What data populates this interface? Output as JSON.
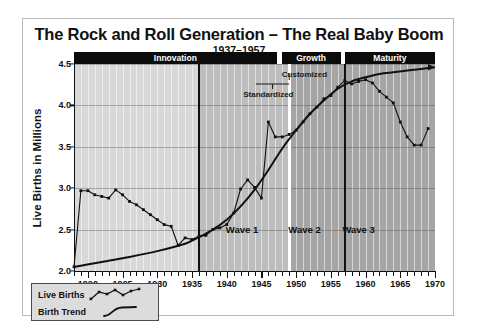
{
  "title": "The Rock and Roll Generation – The Real Baby Boom",
  "subtitle": "1937–1957",
  "legend": {
    "series1_label": "Live Births",
    "series2_label": "Birth Trend"
  },
  "annotations": {
    "standardized": "Standardized",
    "customized": "Customized",
    "wave1": "Wave 1",
    "wave2": "Wave 2",
    "wave3": "Wave 3"
  },
  "phases": [
    {
      "label": "Innovation",
      "start": 1918,
      "end": 1947.2
    },
    {
      "label": "Growth",
      "start": 1947.9,
      "end": 1956.4
    },
    {
      "label": "Maturity",
      "start": 1957.0,
      "end": 1970
    }
  ],
  "colors": {
    "band_light": "#d8d8d8",
    "band_mid": "#bdbdbd",
    "band_dark": "#a5a5a5",
    "phase_bar": "#0b0b0b",
    "line": "#111111",
    "frame": "#b9b9bd",
    "legend_bg": "#dcdcdc"
  },
  "chart_data": {
    "type": "line",
    "title": "The Rock and Roll Generation – The Real Baby Boom",
    "subtitle": "1937–1957",
    "xlabel": "",
    "ylabel": "Live Births in Millions",
    "xlim": [
      1918,
      1970
    ],
    "ylim": [
      2.0,
      4.5
    ],
    "yticks": [
      2.0,
      2.5,
      3.0,
      3.5,
      4.0,
      4.5
    ],
    "xticks": [
      1920,
      1925,
      1930,
      1935,
      1940,
      1945,
      1950,
      1955,
      1960,
      1965,
      1970
    ],
    "xtick_minor_step": 1,
    "grid": true,
    "legend_position": "below-left",
    "series": [
      {
        "name": "Live Births",
        "marker": "square",
        "x": [
          1918,
          1919,
          1920,
          1921,
          1922,
          1923,
          1924,
          1925,
          1926,
          1927,
          1928,
          1929,
          1930,
          1931,
          1932,
          1933,
          1934,
          1935,
          1936,
          1937,
          1938,
          1939,
          1940,
          1941,
          1942,
          1943,
          1944,
          1945,
          1946,
          1947,
          1948,
          1949,
          1950,
          1951,
          1952,
          1953,
          1954,
          1955,
          1956,
          1957,
          1958,
          1959,
          1960,
          1961,
          1962,
          1963,
          1964,
          1965,
          1966,
          1967,
          1968,
          1969
        ],
        "y": [
          2.05,
          2.97,
          2.97,
          2.92,
          2.9,
          2.88,
          2.98,
          2.92,
          2.84,
          2.8,
          2.74,
          2.68,
          2.62,
          2.56,
          2.54,
          2.31,
          2.4,
          2.38,
          2.42,
          2.43,
          2.5,
          2.52,
          2.56,
          2.7,
          2.99,
          3.1,
          3.01,
          2.88,
          3.8,
          3.62,
          3.62,
          3.65,
          3.7,
          3.8,
          3.9,
          3.98,
          4.08,
          4.12,
          4.22,
          4.3,
          4.26,
          4.29,
          4.31,
          4.27,
          4.17,
          4.1,
          4.03,
          3.8,
          3.62,
          3.52,
          3.52,
          3.72
        ]
      },
      {
        "name": "Birth Trend",
        "marker": "none",
        "arrow_end": true,
        "x": [
          1918,
          1922,
          1926,
          1930,
          1934,
          1936,
          1938,
          1940,
          1942,
          1944,
          1946,
          1948,
          1950,
          1952,
          1954,
          1956,
          1958,
          1960,
          1962,
          1964,
          1966,
          1968,
          1970
        ],
        "y": [
          2.05,
          2.11,
          2.17,
          2.24,
          2.33,
          2.41,
          2.5,
          2.62,
          2.78,
          2.98,
          3.22,
          3.48,
          3.7,
          3.9,
          4.06,
          4.2,
          4.29,
          4.34,
          4.38,
          4.4,
          4.42,
          4.44,
          4.46
        ]
      }
    ]
  }
}
